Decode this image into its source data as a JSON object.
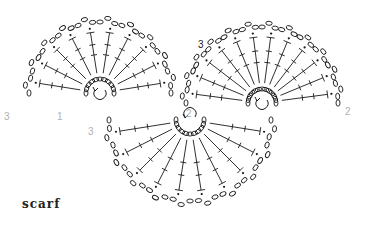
{
  "caption": "scarf",
  "colors": {
    "ink": "#1a1a1a",
    "label_gray": "#b0b0b0"
  },
  "legend_symbols": {
    "chain": "oval",
    "slip_stitch": "dot",
    "double_crochet": "T-post with crossbar",
    "direction": "curved arrow"
  },
  "motifs": [
    {
      "name": "left-fan",
      "cx": 100,
      "cy": 93,
      "start_deg": 180,
      "end_deg": 360,
      "spokes": 10,
      "radius": 75,
      "round_labels": [
        {
          "text": "3",
          "x": 4,
          "y": 120
        },
        {
          "text": "1",
          "x": 57,
          "y": 120
        }
      ],
      "arrow": "counterclockwise"
    },
    {
      "name": "right-fan",
      "cx": 262,
      "cy": 103,
      "start_deg": 180,
      "end_deg": 360,
      "spokes": 12,
      "radius": 80,
      "round_labels": [
        {
          "text": "3",
          "x": 198,
          "y": 48
        },
        {
          "text": "2",
          "x": 345,
          "y": 115
        }
      ],
      "arrow": "counterclockwise",
      "arrow_label": "2"
    },
    {
      "name": "bottom-fan",
      "cx": 190,
      "cy": 120,
      "start_deg": 0,
      "end_deg": 180,
      "spokes": 10,
      "radius": 85,
      "round_labels": [
        {
          "text": "3",
          "x": 88,
          "y": 135
        },
        {
          "text": "2",
          "x": 186,
          "y": 117
        }
      ],
      "arrow": "clockwise"
    }
  ]
}
